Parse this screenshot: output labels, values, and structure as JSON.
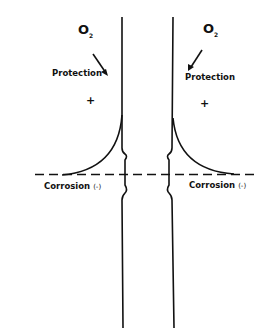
{
  "labels": {
    "o2_left": "O",
    "o2_left_sub": "2",
    "o2_right": "O",
    "o2_right_sub": "2",
    "protection_left": "Protection",
    "protection_right": "Protection",
    "plus_left": "+",
    "plus_right": "+",
    "corrosion_left": "Corrosion",
    "corrosion_left_sign": "(-)",
    "corrosion_right": "Corrosion",
    "corrosion_right_sign": "(-)"
  }
}
